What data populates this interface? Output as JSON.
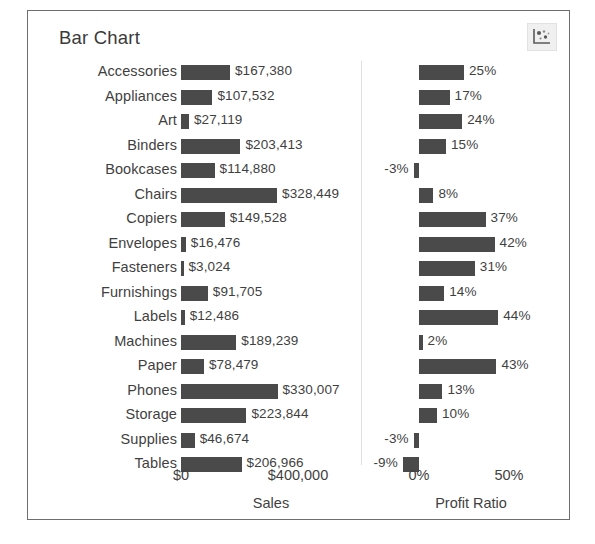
{
  "title": "Bar Chart",
  "toolbar": {
    "icon": "scatter-plot-icon"
  },
  "axes": {
    "sales": {
      "label": "Sales",
      "ticks": [
        "$0",
        "$400,000"
      ]
    },
    "profit_ratio": {
      "label": "Profit Ratio",
      "ticks": [
        "0%",
        "50%"
      ]
    }
  },
  "chart_data": {
    "type": "bar",
    "title": "Bar Chart",
    "orientation": "horizontal",
    "grid": false,
    "legend": null,
    "categories": [
      "Accessories",
      "Appliances",
      "Art",
      "Binders",
      "Bookcases",
      "Chairs",
      "Copiers",
      "Envelopes",
      "Fasteners",
      "Furnishings",
      "Labels",
      "Machines",
      "Paper",
      "Phones",
      "Storage",
      "Supplies",
      "Tables"
    ],
    "series": [
      {
        "name": "Sales",
        "xlabel": "Sales",
        "xlim": [
          0,
          400000
        ],
        "xticks": [
          0,
          400000
        ],
        "xticklabels": [
          "$0",
          "$400,000"
        ],
        "values": [
          167380,
          107532,
          27119,
          203413,
          114880,
          328449,
          149528,
          16476,
          3024,
          91705,
          12486,
          189239,
          78479,
          330007,
          223844,
          46674,
          206966
        ],
        "value_labels": [
          "$167,380",
          "$107,532",
          "$27,119",
          "$203,413",
          "$114,880",
          "$328,449",
          "$149,528",
          "$16,476",
          "$3,024",
          "$91,705",
          "$12,486",
          "$189,239",
          "$78,479",
          "$330,007",
          "$223,844",
          "$46,674",
          "$206,966"
        ]
      },
      {
        "name": "Profit Ratio",
        "xlabel": "Profit Ratio",
        "xlim": [
          -0.1,
          0.5
        ],
        "xticks": [
          0,
          0.5
        ],
        "xticklabels": [
          "0%",
          "50%"
        ],
        "values": [
          0.25,
          0.17,
          0.24,
          0.15,
          -0.03,
          0.08,
          0.37,
          0.42,
          0.31,
          0.14,
          0.44,
          0.02,
          0.43,
          0.13,
          0.1,
          -0.03,
          -0.09
        ],
        "value_labels": [
          "25%",
          "17%",
          "24%",
          "15%",
          "-3%",
          "8%",
          "37%",
          "42%",
          "31%",
          "14%",
          "44%",
          "2%",
          "43%",
          "13%",
          "10%",
          "-3%",
          "-9%"
        ]
      }
    ],
    "colors": {
      "bar": "#4a4a4a",
      "text": "#3f3f3f",
      "border": "#6e6e6e"
    }
  }
}
